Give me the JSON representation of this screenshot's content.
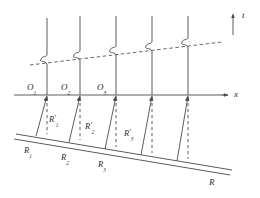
{
  "figure": {
    "type": "line-diagram",
    "colors": {
      "stroke": "#4a4a4a",
      "label": "#2b2b2b",
      "background": "#ffffff"
    }
  },
  "axes": {
    "t_axis": {
      "label": "t",
      "name": "time-axis",
      "orientation": "vertical-up"
    },
    "x_axis": {
      "label": "x",
      "name": "space-axis",
      "orientation": "horizontal-right"
    }
  },
  "origins": [
    {
      "label": "O",
      "sub": "1"
    },
    {
      "label": "O",
      "sub": "2"
    },
    {
      "label": "O",
      "sub": "3"
    }
  ],
  "primed_points": [
    {
      "label": "R",
      "prime": "'",
      "sub": "1"
    },
    {
      "label": "R",
      "prime": "'",
      "sub": "2"
    },
    {
      "label": "R",
      "prime": "'",
      "sub": "3"
    }
  ],
  "base_points": [
    {
      "label": "R",
      "sub": "1"
    },
    {
      "label": "R",
      "sub": "2"
    },
    {
      "label": "R",
      "sub": "3"
    }
  ],
  "reference_line": {
    "label": "R",
    "name": "inclined-reference-line"
  },
  "worldlines": {
    "count": 5,
    "description": "vertical world lines with S-shaped kink where they cross the dashed line"
  },
  "dashed_line": {
    "name": "inclined-dashed-line",
    "description": "dashed line rising to the right crossing all world lines"
  }
}
